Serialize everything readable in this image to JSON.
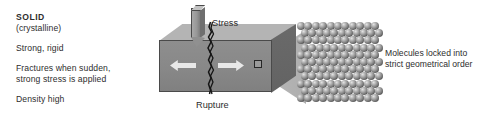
{
  "figure": {
    "background": "#ffffff",
    "text_color": "#2d2d2d"
  },
  "left_text": {
    "title": "SOLID",
    "subtitle": "(crystalline)",
    "property_1": "Strong, rigid",
    "property_2_line_1": "Fractures when sudden,",
    "property_2_line_2": "strong stress is applied",
    "property_3": "Density high"
  },
  "diagram": {
    "stress_label": "Stress",
    "rupture_label": "Rupture",
    "block": {
      "front_face_color": "#888888",
      "top_face_color": "#b4b4b4",
      "side_face_color": "#666666",
      "edge_color": "#4a4a4a"
    },
    "arrows": {
      "left_arrow": "arrow-left",
      "right_arrow": "arrow-right",
      "color": "#e8e8e8"
    },
    "crack": {
      "color": "#1a1a1a",
      "description": "vertical jagged fracture line"
    },
    "zoom_marker": {
      "border_color": "#262626"
    },
    "cone": {
      "color": "#b4b4b4"
    }
  },
  "lattice": {
    "rows": 11,
    "columns": 11,
    "molecule_color": "#7e7e7e",
    "arrangement": "regular close-packed grid"
  },
  "right_caption": {
    "line_1": "Molecules locked into",
    "line_2": "strict geometrical order"
  }
}
